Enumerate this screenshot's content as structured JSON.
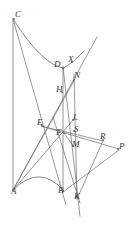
{
  "figure": {
    "background_color": "#fefefe",
    "stroke_color": "#6b6b6b",
    "label_color": "#3a3a3a",
    "width": 133,
    "height": 230,
    "points": [
      {
        "name": "C",
        "label": "C",
        "x": 14,
        "y": 19,
        "lx": 15,
        "ly": 10
      },
      {
        "name": "D",
        "label": "D",
        "x": 63,
        "y": 68,
        "lx": 54,
        "ly": 60
      },
      {
        "name": "X",
        "label": "X",
        "x": 72,
        "y": 62,
        "lx": 68,
        "ly": 55
      },
      {
        "name": "N",
        "label": "N",
        "x": 74,
        "y": 80,
        "lx": 74,
        "ly": 71
      },
      {
        "name": "H",
        "label": "H",
        "x": 62,
        "y": 92,
        "lx": 56,
        "ly": 85
      },
      {
        "name": "E",
        "label": "E",
        "x": 42,
        "y": 125,
        "lx": 37,
        "ly": 118
      },
      {
        "name": "L",
        "label": "L",
        "x": 73,
        "y": 120,
        "lx": 73,
        "ly": 113
      },
      {
        "name": "F",
        "label": "F",
        "x": 64,
        "y": 133,
        "lx": 56,
        "ly": 128
      },
      {
        "name": "S",
        "label": "S",
        "x": 74,
        "y": 131,
        "lx": 74,
        "ly": 125
      },
      {
        "name": "M",
        "label": "M",
        "x": 73,
        "y": 146,
        "lx": 72,
        "ly": 140
      },
      {
        "name": "R",
        "label": "R",
        "x": 103,
        "y": 140,
        "lx": 100,
        "ly": 132
      },
      {
        "name": "P",
        "label": "P",
        "x": 118,
        "y": 149,
        "lx": 119,
        "ly": 142
      },
      {
        "name": "A",
        "label": "A",
        "x": 13,
        "y": 190,
        "lx": 11,
        "ly": 187
      },
      {
        "name": "B",
        "label": "B",
        "x": 63,
        "y": 191,
        "lx": 58,
        "ly": 186
      },
      {
        "name": "K",
        "label": "K",
        "x": 76,
        "y": 197,
        "lx": 74,
        "ly": 192
      }
    ],
    "segments": [
      {
        "name": "vertical-C-A",
        "x1": 13,
        "y1": 19,
        "x2": 13,
        "y2": 191
      },
      {
        "name": "vertical-D-B",
        "x1": 63,
        "y1": 67,
        "x2": 63,
        "y2": 192
      },
      {
        "name": "vertical-N-K",
        "x1": 74,
        "y1": 74,
        "x2": 77,
        "y2": 199
      },
      {
        "name": "line-C-to-B",
        "x1": 13,
        "y1": 19,
        "x2": 66,
        "y2": 205
      },
      {
        "name": "line-A-to-X",
        "x1": 13,
        "y1": 190,
        "x2": 97,
        "y2": 37
      },
      {
        "name": "line-A-to-N",
        "x1": 13,
        "y1": 190,
        "x2": 75,
        "y2": 79
      },
      {
        "name": "line-A-to-L",
        "x1": 13,
        "y1": 190,
        "x2": 74,
        "y2": 119
      },
      {
        "name": "line-D-to-K",
        "x1": 63,
        "y1": 67,
        "x2": 80,
        "y2": 216
      },
      {
        "name": "line-E-to-P",
        "x1": 41,
        "y1": 126,
        "x2": 119,
        "y2": 149
      },
      {
        "name": "line-B-to-P",
        "x1": 63,
        "y1": 192,
        "x2": 119,
        "y2": 150
      },
      {
        "name": "line-F-to-K",
        "x1": 53,
        "y1": 117,
        "x2": 80,
        "y2": 203
      },
      {
        "name": "line-E-to-R-down",
        "x1": 41,
        "y1": 126,
        "x2": 103,
        "y2": 141
      },
      {
        "name": "line-R-to-K",
        "x1": 103,
        "y1": 141,
        "x2": 77,
        "y2": 199
      },
      {
        "name": "line-F-to-M",
        "x1": 64,
        "y1": 133,
        "x2": 74,
        "y2": 147
      }
    ],
    "curves": [
      {
        "name": "upper-hyperbola-arc-C-D",
        "d": "M 13 19 Q 43 66 64 68"
      },
      {
        "name": "lower-arc-A-B",
        "d": "M 13 190 Q 40 163 64 191"
      },
      {
        "name": "upper-arc-tail-D-X",
        "d": "M 64 68 Q 74 62 84 51"
      }
    ]
  }
}
